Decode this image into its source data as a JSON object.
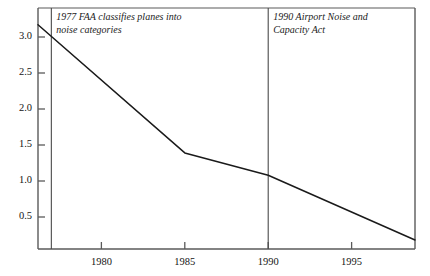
{
  "chart_data": {
    "type": "line",
    "title": "",
    "xlabel": "",
    "ylabel": "",
    "xlim": [
      1976.2,
      1998.8
    ],
    "ylim": [
      0.0,
      3.5
    ],
    "grid": false,
    "legend": "none",
    "yticks": [
      "0.5",
      "1.0",
      "1.5",
      "2.0",
      "2.5",
      "3.0"
    ],
    "ytick_values": [
      0.5,
      1.0,
      1.5,
      2.0,
      2.5,
      3.0
    ],
    "xticks": [
      "1980",
      "1985",
      "1990",
      "1995"
    ],
    "xtick_values": [
      1980,
      1985,
      1990,
      1995
    ],
    "series": [
      {
        "name": "noise exposure",
        "x": [
          1976.2,
          1985,
          1990,
          1998.8
        ],
        "values": [
          3.17,
          1.39,
          1.08,
          0.18
        ]
      }
    ],
    "reference_lines": [
      {
        "x": 1977,
        "label": "1977 FAA classifies planes into\nnoise categories"
      },
      {
        "x": 1990,
        "label": "1990 Airport Noise and\nCapacity Act"
      }
    ],
    "colors": {
      "line": "#1a1a1a",
      "axis": "#5a5a5a",
      "reference_line": "#4a4a4a",
      "background": "#ffffff"
    }
  }
}
